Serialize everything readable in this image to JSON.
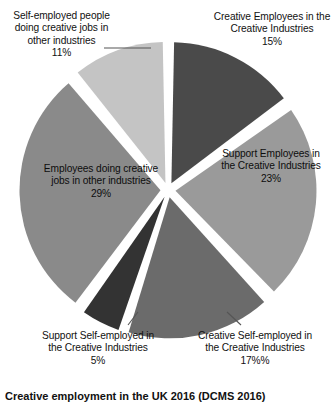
{
  "caption": "Creative employment in the UK 2016 (DCMS 2016)",
  "labels": {
    "self_employed_other": "Self-employed people doing creative jobs in other industries\n11%",
    "creative_employees": "Creative Employees in the Creative Industries\n15%",
    "support_employees": "Support Employees in the Creative Industries\n23%",
    "employees_other": "Employees doing creative jobs in other industries\n29%",
    "support_self_employed": "Support Self-employed in the Creative Industries\n5%",
    "creative_self_employed": "Creative Self-employed in the Creative Industries\n17%%"
  },
  "chart_data": {
    "type": "pie",
    "title": "Creative employment in the UK 2016 (DCMS 2016)",
    "exploded": true,
    "legend_position": "none",
    "labels_show_percent": true,
    "categories": [
      "Creative Employees in the Creative Industries",
      "Support Employees in the Creative Industries",
      "Creative Self-employed in the Creative Industries",
      "Support Self-employed in the Creative Industries",
      "Employees doing creative jobs in other industries",
      "Self-employed people doing creative jobs in other industries"
    ],
    "values": [
      15,
      23,
      17,
      5,
      29,
      11
    ],
    "value_labels": [
      "15%",
      "23%",
      "17%%",
      "5%",
      "29%",
      "11%"
    ],
    "colors": [
      "#4a4a4a",
      "#9a9a9a",
      "#6b6b6b",
      "#333333",
      "#8a8a8a",
      "#c4c4c4"
    ],
    "total": 100
  }
}
